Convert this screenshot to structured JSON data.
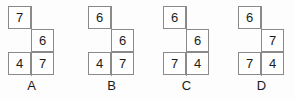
{
  "page": {
    "background_color": "#fdfdfd",
    "line_color": "#8a8a8a",
    "text_color": "#1b1b1b",
    "cell_size_px": 23,
    "shape_description": "two-column three-row staircase: top-left cell, middle-right cell, bottom-left and bottom-right cells"
  },
  "figures": [
    {
      "label": "A",
      "cells": {
        "top_left": "7",
        "middle_right": "6",
        "bottom_left": "4",
        "bottom_right": "7"
      }
    },
    {
      "label": "B",
      "cells": {
        "top_left": "6",
        "middle_right": "6",
        "bottom_left": "4",
        "bottom_right": "7"
      }
    },
    {
      "label": "C",
      "cells": {
        "top_left": "6",
        "middle_right": "6",
        "bottom_left": "7",
        "bottom_right": "4"
      }
    },
    {
      "label": "D",
      "cells": {
        "top_left": "6",
        "middle_right": "7",
        "bottom_left": "7",
        "bottom_right": "4"
      }
    }
  ]
}
